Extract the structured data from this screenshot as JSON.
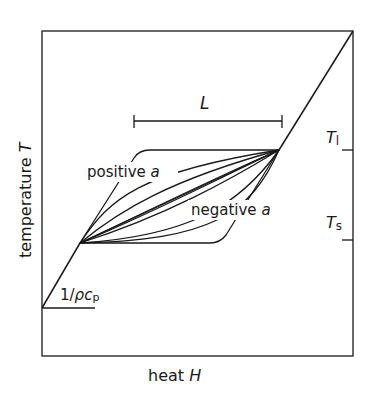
{
  "diagram": {
    "ylabel_text": "temperature ",
    "ylabel_var": "T",
    "xlabel_text": "heat ",
    "xlabel_var": "H",
    "latent_label": "L",
    "liquidus_label": "T",
    "liquidus_sub": "l",
    "solidus_label": "T",
    "solidus_sub": "s",
    "positive_label": "positive ",
    "negative_label": "negative ",
    "param_var": "a",
    "slope_label_prefix": "1/",
    "slope_rho": "ρ",
    "slope_c": "c",
    "slope_sub": "p",
    "line_color": "#1a1a1a"
  }
}
